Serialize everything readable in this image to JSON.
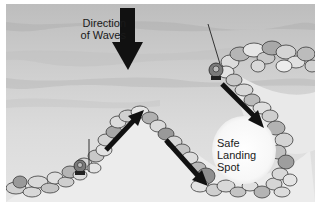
{
  "diagram": {
    "labels": {
      "waves_line1": "Direction",
      "waves_line2": "of Waves",
      "safe_line1": "Safe",
      "safe_line2": "Landing",
      "safe_line3": "Spot"
    },
    "elements": [
      {
        "name": "wave-direction-arrow",
        "direction": "down"
      },
      {
        "name": "lighthouse-marker-upper-right"
      },
      {
        "name": "lighthouse-marker-lower-left"
      },
      {
        "name": "rock-breakwater-left"
      },
      {
        "name": "rock-breakwater-right"
      },
      {
        "name": "current-arrows",
        "count": 3
      },
      {
        "name": "safe-landing-spot"
      }
    ],
    "colors": {
      "water": "#c9c9c9",
      "water_light": "#e6e6e6",
      "rock_fill": "#d4d4d4",
      "rock_dark": "#9a9a9a",
      "rock_outline": "#3a3a3a",
      "arrow": "#111111",
      "border": "#ffffff"
    }
  }
}
